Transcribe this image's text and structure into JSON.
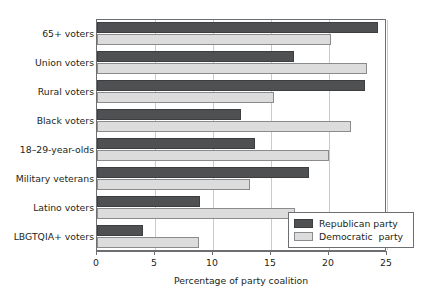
{
  "chart_data": {
    "type": "bar",
    "orientation": "horizontal",
    "title": "",
    "xlabel": "Percentage of party coalition",
    "ylabel": "",
    "xlim": [
      0,
      25
    ],
    "xticks": [
      0,
      5,
      10,
      15,
      20,
      25
    ],
    "xtick_labels": [
      "0",
      "5",
      "10",
      "15",
      "20",
      "25"
    ],
    "grid": true,
    "grid_axis": "x",
    "legend_position": "bottom-right",
    "categories": [
      "65+ voters",
      "Union voters",
      "Rural voters",
      "Black voters",
      "18–29-year-olds",
      "Military veterans",
      "Latino voters",
      "LBGTQIA+ voters"
    ],
    "series": [
      {
        "name": "Republican party",
        "color": "#4f5052",
        "values": [
          24.2,
          17.0,
          23.1,
          12.4,
          13.6,
          18.3,
          8.9,
          4.0
        ]
      },
      {
        "name": "Democratic  party",
        "color": "#dcdcdc",
        "values": [
          20.2,
          23.3,
          15.3,
          21.9,
          20.0,
          13.2,
          17.1,
          8.8
        ]
      }
    ]
  },
  "legend": {
    "entries": [
      {
        "label": "Republican party",
        "swatch": "rep"
      },
      {
        "label": "Democratic  party",
        "swatch": "dem"
      }
    ]
  }
}
